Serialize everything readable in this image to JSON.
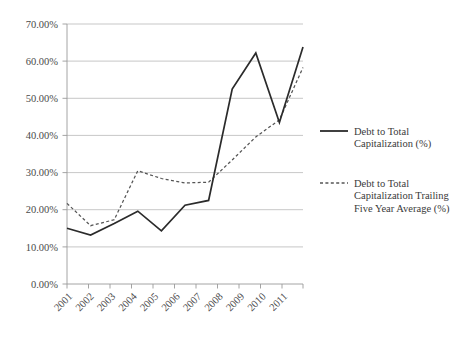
{
  "chart_data": {
    "type": "line",
    "title": "",
    "xlabel": "",
    "ylabel": "",
    "categories": [
      "2001",
      "2002",
      "2003",
      "2004",
      "2005",
      "2006",
      "2007",
      "2008",
      "2009",
      "2010",
      "2011"
    ],
    "ylim": [
      0,
      70
    ],
    "ytick_labels": [
      "0.00%",
      "10.00%",
      "20.00%",
      "30.00%",
      "40.00%",
      "50.00%",
      "60.00%",
      "70.00%"
    ],
    "ytick_values": [
      0,
      10,
      20,
      30,
      40,
      50,
      60,
      70
    ],
    "grid": true,
    "legend_position": "right",
    "series": [
      {
        "name": "Debt to Total Capitalization (%)",
        "style": "solid",
        "color": "#2b2b2b",
        "values": [
          15.0,
          13.2,
          16.3,
          19.6,
          14.3,
          21.2,
          22.5,
          52.5,
          62.2,
          43.5,
          63.8
        ]
      },
      {
        "name": "Debt to Total Capitalization Trailing Five Year Average (%)",
        "style": "dashed",
        "color": "#555555",
        "values": [
          21.7,
          15.7,
          17.3,
          30.5,
          28.4,
          27.2,
          27.4,
          33.4,
          39.6,
          44.2,
          58.3
        ]
      }
    ]
  },
  "legend": {
    "entries": [
      {
        "label_line1": "Debt to Total",
        "label_line2": "Capitalization (%)",
        "label_line3": ""
      },
      {
        "label_line1": "Debt to Total",
        "label_line2": "Capitalization Trailing",
        "label_line3": "Five Year Average (%)"
      }
    ]
  }
}
